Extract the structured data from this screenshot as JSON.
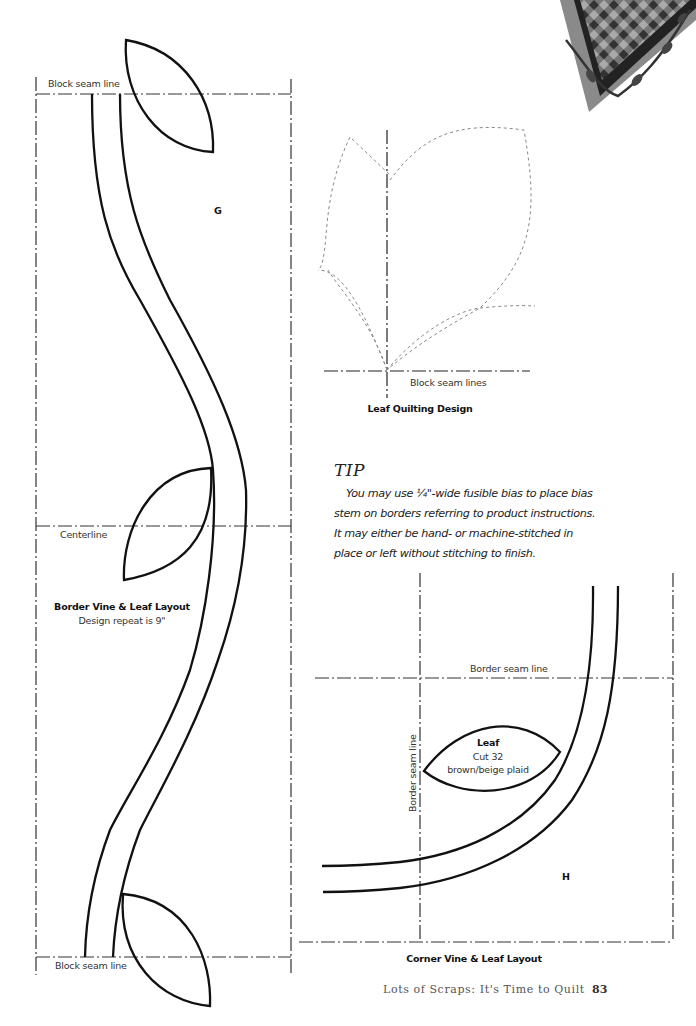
{
  "figures": {
    "border_layout": {
      "top_seam_label": "Block seam line",
      "bottom_seam_label": "Block seam line",
      "centerline_label": "Centerline",
      "piece_label": "G",
      "title": "Border Vine & Leaf Layout",
      "subtitle": "Design repeat is 9\""
    },
    "leaf_quilting": {
      "seam_label": "Block seam lines",
      "title": "Leaf Quilting Design"
    },
    "corner_layout": {
      "border_seam_label_h": "Border seam line",
      "border_seam_label_v": "Border seam line",
      "leaf_title": "Leaf",
      "leaf_cut": "Cut 32",
      "leaf_fabric": "brown/beige plaid",
      "piece_label": "H",
      "title": "Corner Vine & Leaf Layout"
    }
  },
  "tip": {
    "title": "TIP",
    "body_lines": [
      "You may use ¼\"-wide fusible bias to place bias",
      "stem on borders referring to product instructions.",
      "It may either be hand- or machine-stitched in",
      "place or left without stitching to finish."
    ]
  },
  "footer": {
    "book_title": "Lots of Scraps: It's Time to Quilt",
    "page_number": "83"
  },
  "colors": {
    "line": "#111111",
    "dashed_quilting": "#888888",
    "text": "#333333"
  }
}
